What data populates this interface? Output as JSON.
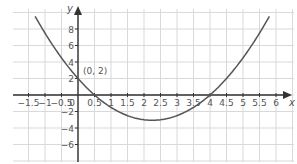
{
  "chart_data": {
    "type": "line",
    "title": "",
    "xlabel": "x",
    "ylabel": "y",
    "xlim": [
      -1.75,
      6.25
    ],
    "ylim": [
      -8.2,
      10.2
    ],
    "grid": true,
    "x_ticks": [
      -1.5,
      -1,
      -0.5,
      0,
      0.5,
      1,
      1.5,
      2,
      2.5,
      3,
      3.5,
      4,
      4.5,
      5,
      5.5,
      6
    ],
    "x_tick_labels": [
      "-1.5",
      "-1",
      "-0.5",
      "0",
      "0.5",
      "1",
      "1.5",
      "2",
      "2.5",
      "3",
      "3.5",
      "4",
      "4.5",
      "5",
      "5.5",
      "6"
    ],
    "y_ticks": [
      -6,
      -4,
      -2,
      2,
      4,
      6,
      8
    ],
    "y_tick_labels": [
      "-6",
      "-4",
      "-2",
      "2",
      "4",
      "6",
      "8"
    ],
    "series": [
      {
        "name": "y = x^2 - 4.5x + 2",
        "x": [
          -1.3,
          -1,
          -0.5,
          0,
          0.5,
          1,
          1.5,
          2,
          2.25,
          2.5,
          3,
          3.5,
          4,
          4.5,
          5,
          5.5,
          5.8
        ],
        "values": [
          9.54,
          7.5,
          4.5,
          2,
          0,
          -1.5,
          -2.5,
          -3,
          -3.06,
          -3,
          -2.5,
          -1.5,
          0,
          2,
          4.5,
          7.5,
          9.54
        ]
      }
    ],
    "annotations": [
      {
        "text": "(0, 2)",
        "x": 0,
        "y": 2
      }
    ]
  },
  "colors": {
    "curve": "#555555",
    "axis": "#333333",
    "grid": "#d9d9d9",
    "text": "#555555"
  }
}
